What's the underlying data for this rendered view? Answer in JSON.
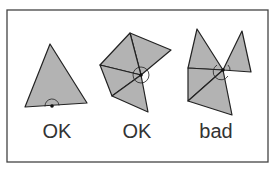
{
  "figure": {
    "frame": {
      "x": 7,
      "y": 10,
      "width": 261,
      "height": 152,
      "stroke": "#444444"
    },
    "colors": {
      "fill": "#b3b3b3",
      "stroke": "#222222",
      "background": "#ffffff"
    },
    "panels": [
      {
        "label": "OK",
        "label_pos": [
          57,
          137
        ],
        "description": "single triangle, vertex on bottom edge with half-circle angle arc",
        "polygons": [
          [
            [
              50,
              44
            ],
            [
              25,
              107
            ],
            [
              87,
              103
            ]
          ]
        ],
        "edges": [],
        "vertex": [
          52,
          106
        ],
        "arc": {
          "r": 7,
          "kind": "upper-half"
        }
      },
      {
        "label": "OK",
        "label_pos": [
          137,
          137
        ],
        "description": "fan of triangles around interior vertex forming closed neighborhood",
        "polygons": [
          [
            [
              130,
              33
            ],
            [
              171,
              50
            ],
            [
              141,
              75
            ]
          ],
          [
            [
              130,
              33
            ],
            [
              100,
              65
            ],
            [
              141,
              75
            ]
          ],
          [
            [
              100,
              65
            ],
            [
              112,
              96
            ],
            [
              141,
              75
            ]
          ],
          [
            [
              112,
              96
            ],
            [
              148,
              112
            ],
            [
              141,
              75
            ]
          ]
        ],
        "vertex": [
          141,
          75
        ],
        "arc": {
          "r": 8,
          "kind": "full"
        }
      },
      {
        "label": "bad",
        "label_pos": [
          216,
          137
        ],
        "description": "two fans meeting at a single non-manifold vertex",
        "polygons": [
          [
            [
              197,
              29
            ],
            [
              188,
              68
            ],
            [
              223,
              70
            ]
          ],
          [
            [
              188,
              68
            ],
            [
              188,
              101
            ],
            [
              223,
              70
            ]
          ],
          [
            [
              188,
              101
            ],
            [
              232,
              115
            ],
            [
              223,
              70
            ]
          ],
          [
            [
              242,
              31
            ],
            [
              223,
              70
            ],
            [
              251,
              72
            ]
          ]
        ],
        "vertex": [
          223,
          70
        ],
        "arc": {
          "r": 8,
          "kind": "split"
        }
      }
    ]
  }
}
